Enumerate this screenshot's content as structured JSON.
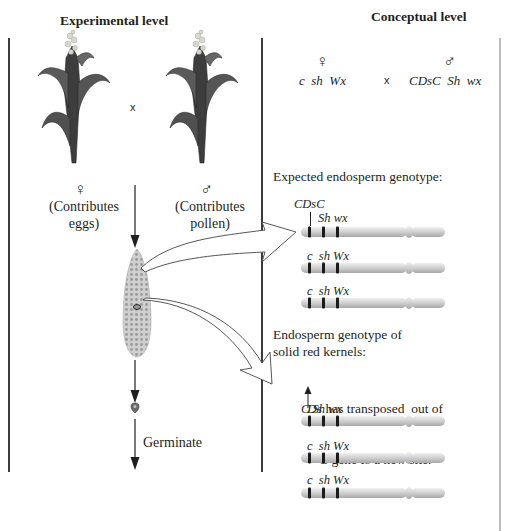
{
  "headers": {
    "experimental": "Experimental level",
    "conceptual": "Conceptual level"
  },
  "experimental": {
    "cross_symbol": "x",
    "female": {
      "symbol": "♀",
      "label_line1": "(Contributes",
      "label_line2": "eggs)"
    },
    "male": {
      "symbol": "♂",
      "label_line1": "(Contributes",
      "label_line2": "pollen)"
    },
    "germinate_label": "Germinate"
  },
  "conceptual": {
    "female": {
      "symbol": "♀",
      "genotype": "c  sh  Wx"
    },
    "cross_symbol": "x",
    "male": {
      "symbol": "♂",
      "genotype": "CDsC  Sh  wx"
    },
    "expected": {
      "title": "Expected endosperm genotype:",
      "top_label": "CDsC",
      "chromosomes": [
        {
          "label": "Sh wx"
        },
        {
          "label": "c  sh Wx"
        },
        {
          "label": "c  sh Wx"
        }
      ]
    },
    "solid_red": {
      "title_line1": "Endosperm genotype of",
      "title_line2": "solid red kernels:",
      "note_ds": "Ds",
      "note_line1_rest": " has transposed  out of",
      "note_c": "C",
      "note_line2_rest": " gene to a new site.",
      "chromosomes": [
        {
          "label": "C Sh wx"
        },
        {
          "label": "c  sh Wx"
        },
        {
          "label": "c  sh Wx"
        }
      ]
    }
  },
  "colors": {
    "line": "#3b3b3b",
    "right_border": "#bdbdbd",
    "chromosome_body": "#d4d4d4",
    "band": "#1a1a1a"
  }
}
